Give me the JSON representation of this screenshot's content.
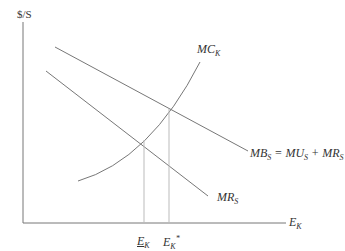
{
  "diagram": {
    "y_axis_label": "$/S",
    "x_axis_label": {
      "main": "E",
      "sub": "K"
    },
    "curves": [
      {
        "id": "mc",
        "label_main": "MC",
        "label_sub": "K"
      },
      {
        "id": "mb",
        "label_parts": [
          {
            "main": "MB",
            "sub": "S"
          },
          {
            "text": " = "
          },
          {
            "main": "MU",
            "sub": "S"
          },
          {
            "text": " + "
          },
          {
            "main": "MR",
            "sub": "S"
          }
        ]
      },
      {
        "id": "mr",
        "label_main": "MR",
        "label_sub": "S"
      }
    ],
    "x_markers": [
      {
        "id": "ek-private",
        "main": "E",
        "sub": "K",
        "underline": true,
        "sup": ""
      },
      {
        "id": "ek-star",
        "main": "E",
        "sub": "K",
        "underline": false,
        "sup": "*"
      }
    ],
    "line_color": "#777777",
    "guide_color": "#bbbbbb"
  }
}
